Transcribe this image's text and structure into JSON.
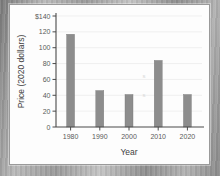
{
  "chart_data": {
    "type": "bar",
    "title": "",
    "subtitle": "",
    "xlabel": "Year",
    "ylabel": "Price (2020 dollars)",
    "categories": [
      "1980",
      "1990",
      "2000",
      "2010",
      "2020"
    ],
    "values": [
      117,
      46,
      41,
      84,
      41
    ],
    "series": [
      {
        "name": "Price",
        "values": [
          117,
          46,
          41,
          84,
          41
        ]
      }
    ],
    "ylim": [
      0,
      140
    ],
    "yticks": [
      0,
      20,
      40,
      60,
      80,
      100,
      120,
      140
    ],
    "ytick_labels": [
      "0",
      "20",
      "40",
      "60",
      "80",
      "100",
      "120",
      "$140"
    ],
    "xtick_labels": [
      "1980",
      "1990",
      "2000",
      "2010",
      "2020"
    ],
    "grid": true,
    "legend": "none",
    "bar_color": "#8d8d8d",
    "axis_color": "#4a4a4a",
    "grid_color": "#e9e9e9",
    "panel_background": "#fdfdfd"
  },
  "figure": {
    "y_axis_label": "Price (2020 dollars)",
    "x_axis_label": "Year"
  }
}
